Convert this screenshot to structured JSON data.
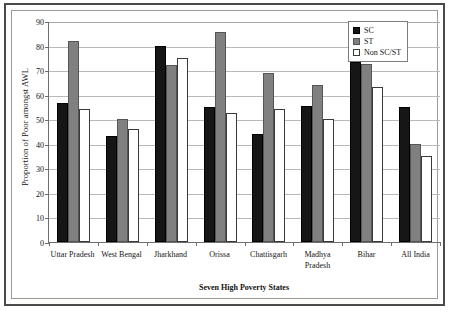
{
  "chart_data": {
    "type": "bar",
    "title": "",
    "xlabel": "Seven High Poverty States",
    "ylabel": "Proportion of Poor amongst AWL",
    "ylim": [
      0,
      90
    ],
    "yticks": [
      0,
      10,
      20,
      30,
      40,
      50,
      60,
      70,
      80,
      90
    ],
    "grid": true,
    "legend_position": "top-right",
    "categories": [
      "Uttar Pradesh",
      "West Bengal",
      "Jharkhand",
      "Orissa",
      "Chattisgarh",
      "Madhya Pradesh",
      "Bihar",
      "All India"
    ],
    "series": [
      {
        "name": "SC",
        "color": "#161616",
        "values": [
          56.5,
          43,
          80,
          55,
          44,
          55.5,
          73.5,
          55
        ]
      },
      {
        "name": "ST",
        "color": "#808080",
        "values": [
          82,
          50,
          72,
          85.5,
          69,
          64,
          72.5,
          40
        ]
      },
      {
        "name": "Non SC/ST",
        "color": "#ffffff",
        "values": [
          54,
          46,
          75,
          52.5,
          54,
          50,
          63,
          35
        ]
      }
    ]
  },
  "axes": {
    "y_title": "Proportion of Poor amongst AWL",
    "x_title": "Seven High Poverty States",
    "y_tick_labels": [
      "90",
      "80",
      "70",
      "60",
      "50",
      "40",
      "30",
      "20",
      "10",
      "0"
    ],
    "x_tick_labels": [
      "Uttar Pradesh",
      "West Bengal",
      "Jharkhand",
      "Orissa",
      "Chattisgarh",
      "Madhya Pradesh",
      "Bihar",
      "All India"
    ]
  },
  "legend": {
    "items": [
      {
        "label": "SC",
        "key": "sc"
      },
      {
        "label": "ST",
        "key": "st"
      },
      {
        "label": "Non SC/ST",
        "key": "nonscst"
      }
    ]
  }
}
